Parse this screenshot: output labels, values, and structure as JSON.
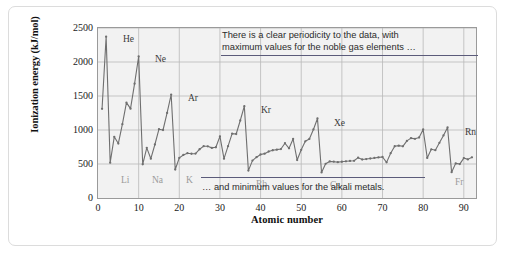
{
  "figure": {
    "y_axis_title": "Ionization energy (kJ/mol)",
    "x_axis_title": "Atomic number",
    "annotation_top": "There is a clear periodicity to the data, with",
    "annotation_top_line2": "maximum values for the noble gas elements …",
    "annotation_bottom": "… and minimum values for the alkali metals.",
    "colors": {
      "plot_background": "#f2f2f2",
      "grid": "#b9b9b9",
      "series_line": "#6f6f6f",
      "marker": "#6f6f6f",
      "annotation_rule": "#5b5b7a",
      "alkali_label": "#9b9b9b",
      "noble_label": "#3a3a3a",
      "frame": "#dcdcdc"
    }
  },
  "chart_data": {
    "type": "line",
    "title": "",
    "xlabel": "Atomic number",
    "ylabel": "Ionization energy (kJ/mol)",
    "xlim": [
      0,
      93
    ],
    "ylim": [
      0,
      2500
    ],
    "xticks": [
      0,
      10,
      20,
      30,
      40,
      50,
      60,
      70,
      80,
      90
    ],
    "yticks": [
      0,
      500,
      1000,
      1500,
      2000,
      2500
    ],
    "grid": true,
    "legend": "none",
    "x": [
      1,
      2,
      3,
      4,
      5,
      6,
      7,
      8,
      9,
      10,
      11,
      12,
      13,
      14,
      15,
      16,
      17,
      18,
      19,
      20,
      21,
      22,
      23,
      24,
      25,
      26,
      27,
      28,
      29,
      30,
      31,
      32,
      33,
      34,
      35,
      36,
      37,
      38,
      39,
      40,
      41,
      42,
      43,
      44,
      45,
      46,
      47,
      48,
      49,
      50,
      51,
      52,
      53,
      54,
      55,
      56,
      57,
      58,
      59,
      60,
      61,
      62,
      63,
      64,
      65,
      66,
      67,
      68,
      69,
      70,
      71,
      72,
      73,
      74,
      75,
      76,
      77,
      78,
      79,
      80,
      81,
      82,
      83,
      84,
      85,
      86,
      87,
      88,
      89,
      90,
      91,
      92
    ],
    "values": [
      1312,
      2372,
      520,
      900,
      801,
      1086,
      1402,
      1314,
      1681,
      2081,
      496,
      738,
      578,
      787,
      1012,
      1000,
      1251,
      1521,
      419,
      590,
      633,
      659,
      651,
      653,
      717,
      762,
      760,
      737,
      746,
      906,
      579,
      762,
      947,
      941,
      1140,
      1351,
      403,
      550,
      600,
      640,
      652,
      684,
      702,
      711,
      720,
      805,
      731,
      868,
      558,
      709,
      834,
      869,
      1008,
      1170,
      376,
      503,
      538,
      534,
      527,
      533,
      540,
      545,
      547,
      593,
      566,
      573,
      581,
      589,
      597,
      603,
      524,
      659,
      761,
      770,
      760,
      840,
      880,
      870,
      890,
      1007,
      589,
      716,
      703,
      812,
      920,
      1037,
      380,
      509,
      499,
      587,
      568,
      598
    ],
    "series_name": "First ionization energy",
    "point_labels": [
      {
        "symbol": "He",
        "atomic_number": 2,
        "value": 2372,
        "position": "above"
      },
      {
        "symbol": "Ne",
        "atomic_number": 10,
        "value": 2081,
        "position": "above"
      },
      {
        "symbol": "Ar",
        "atomic_number": 18,
        "value": 1521,
        "position": "above"
      },
      {
        "symbol": "Kr",
        "atomic_number": 36,
        "value": 1351,
        "position": "above"
      },
      {
        "symbol": "Xe",
        "atomic_number": 54,
        "value": 1170,
        "position": "above"
      },
      {
        "symbol": "Rn",
        "atomic_number": 86,
        "value": 1037,
        "position": "above"
      },
      {
        "symbol": "Li",
        "atomic_number": 3,
        "value": 520,
        "position": "below"
      },
      {
        "symbol": "Na",
        "atomic_number": 11,
        "value": 496,
        "position": "below"
      },
      {
        "symbol": "K",
        "atomic_number": 19,
        "value": 419,
        "position": "below"
      },
      {
        "symbol": "Rb",
        "atomic_number": 37,
        "value": 403,
        "position": "below"
      },
      {
        "symbol": "Cs",
        "atomic_number": 55,
        "value": 376,
        "position": "below"
      },
      {
        "symbol": "Fr",
        "atomic_number": 87,
        "value": 380,
        "position": "below"
      }
    ],
    "annotations": [
      "There is a clear periodicity to the data, with maximum values for the noble gas elements …",
      "… and minimum values for the alkali metals."
    ]
  }
}
